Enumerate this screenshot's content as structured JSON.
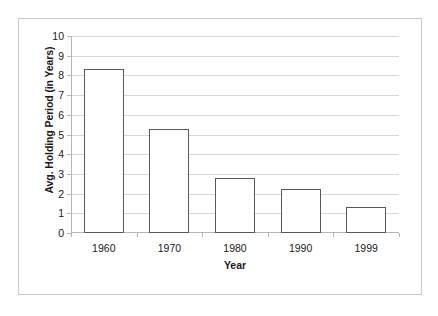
{
  "chart_data": {
    "type": "bar",
    "title": "",
    "categories": [
      "1960",
      "1970",
      "1980",
      "1990",
      "1999"
    ],
    "values": [
      8.3,
      5.3,
      2.8,
      2.25,
      1.3
    ],
    "series": [
      {
        "name": "Avg. Holding Period",
        "values": [
          8.3,
          5.3,
          2.8,
          2.25,
          1.3
        ]
      }
    ],
    "xlabel": "Year",
    "ylabel": "Avg. Holding Period (in Years)",
    "ylim": [
      0,
      10
    ],
    "yticks": [
      0,
      1,
      2,
      3,
      4,
      5,
      6,
      7,
      8,
      9,
      10
    ],
    "ytick_labels": [
      "0",
      "1",
      "2",
      "3",
      "4",
      "5",
      "6",
      "7",
      "8",
      "9",
      "10"
    ],
    "grid": true,
    "grid_axis": "y",
    "legend": false,
    "legend_position": "none",
    "bar_fill_color": "#ffffff",
    "bar_border_color": "#595959",
    "gridline_color": "#d8d8d8",
    "axis_color": "#b5b5b5",
    "text_color": "#1a1a1a",
    "plot_background": "#ffffff",
    "frame_border_color": "#c9c9c9"
  }
}
